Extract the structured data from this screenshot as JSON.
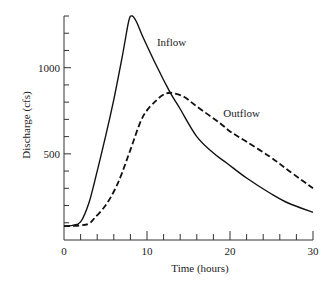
{
  "chart_data": {
    "type": "line",
    "title": "",
    "xlabel": "Time (hours)",
    "ylabel": "Discharge (cfs)",
    "xlim": [
      0,
      30
    ],
    "ylim": [
      0,
      1300
    ],
    "grid": false,
    "legend": "inline labels",
    "x_ticks": [
      0,
      10,
      20,
      30
    ],
    "x_minor_step": 2,
    "y_ticks": [
      500,
      1000
    ],
    "y_minor_step": 100,
    "x_zero_label": "0",
    "series": [
      {
        "name": "Inflow",
        "style": "solid",
        "label_pos": {
          "t": 11.2,
          "q": 1125
        },
        "points": [
          [
            0,
            80
          ],
          [
            1,
            85
          ],
          [
            2,
            105
          ],
          [
            3,
            215
          ],
          [
            4,
            400
          ],
          [
            5,
            600
          ],
          [
            6,
            815
          ],
          [
            7,
            1060
          ],
          [
            7.8,
            1270
          ],
          [
            8.2,
            1300
          ],
          [
            8.7,
            1270
          ],
          [
            9.5,
            1180
          ],
          [
            11.2,
            1005
          ],
          [
            12.8,
            855
          ],
          [
            14,
            760
          ],
          [
            16,
            600
          ],
          [
            18,
            505
          ],
          [
            19.6,
            447
          ],
          [
            22,
            360
          ],
          [
            24.8,
            273
          ],
          [
            27,
            215
          ],
          [
            30,
            160
          ]
        ]
      },
      {
        "name": "Outflow",
        "style": "dashed",
        "label_pos": {
          "t": 19.2,
          "q": 715
        },
        "points": [
          [
            0,
            80
          ],
          [
            2,
            85
          ],
          [
            3,
            95
          ],
          [
            3.7,
            128
          ],
          [
            5,
            200
          ],
          [
            6.1,
            290
          ],
          [
            7,
            390
          ],
          [
            8,
            523
          ],
          [
            9.5,
            715
          ],
          [
            11.2,
            814
          ],
          [
            12.3,
            850
          ],
          [
            13.2,
            852
          ],
          [
            14.5,
            830
          ],
          [
            16,
            775
          ],
          [
            18.8,
            678
          ],
          [
            20,
            630
          ],
          [
            22,
            570
          ],
          [
            24.8,
            484
          ],
          [
            27,
            405
          ],
          [
            30,
            300
          ]
        ]
      }
    ]
  }
}
